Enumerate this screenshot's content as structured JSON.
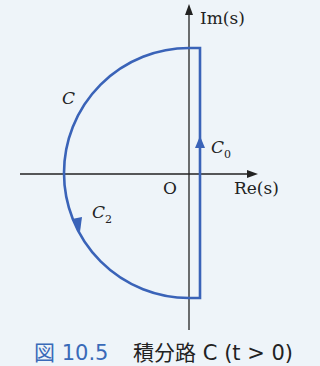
{
  "figure": {
    "axes": {
      "imag_label": "Im(s)",
      "real_label": "Re(s)",
      "origin_label": "O"
    },
    "contour_labels": {
      "c": "C",
      "c0_main": "C",
      "c0_sub": "0",
      "c2_main": "C",
      "c2_sub": "2"
    },
    "colors": {
      "contour": "#3a63b8",
      "axis": "#222222",
      "background": "#eef4f9",
      "caption_number": "#3a6ab8"
    }
  },
  "caption": {
    "number": "図 10.5",
    "text": "積分路 C (t > 0)"
  }
}
